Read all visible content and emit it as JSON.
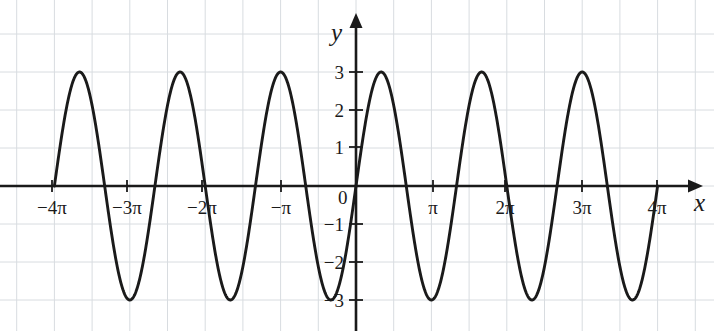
{
  "figure": {
    "background_color": "#ffffff",
    "grid_color": "#d8dce0",
    "axis_color": "#1a1a1a",
    "curve_color": "#1a1a1a",
    "axis_x_name": "x",
    "axis_y_name": "y",
    "origin_label": "0"
  },
  "chart_data": {
    "type": "line",
    "title": "",
    "xlabel": "x",
    "ylabel": "y",
    "expression": "y = 3 sin(3x/2)",
    "amplitude": 3,
    "period": "4π/3",
    "grid": true,
    "legend": "none",
    "xlim": [
      -12.566,
      12.566
    ],
    "ylim": [
      -3.6,
      3.6
    ],
    "x_tick_labels": [
      "−4π",
      "−3π",
      "−2π",
      "−π",
      "π",
      "2π",
      "3π",
      "4π"
    ],
    "x_tick_values": [
      -12.566,
      -9.425,
      -6.283,
      -3.142,
      3.142,
      6.283,
      9.425,
      12.566
    ],
    "y_tick_labels": [
      "3",
      "2",
      "1",
      "0",
      "−1",
      "−2",
      "−3"
    ],
    "y_tick_values": [
      3,
      2,
      1,
      0,
      -1,
      -2,
      -3
    ],
    "x": [
      -12.566,
      -12.042,
      -11.519,
      -10.996,
      -10.472,
      -9.949,
      -9.425,
      -8.902,
      -8.378,
      -7.854,
      -7.33,
      -6.807,
      -6.283,
      -5.76,
      -5.236,
      -4.712,
      -4.189,
      -3.665,
      -3.142,
      -2.618,
      -2.094,
      -1.571,
      -1.047,
      -0.524,
      0,
      0.524,
      1.047,
      1.571,
      2.094,
      2.618,
      3.142,
      3.665,
      4.189,
      4.712,
      5.236,
      5.76,
      6.283,
      6.807,
      7.33,
      7.854,
      8.378,
      8.902,
      9.425,
      9.949,
      10.472,
      10.996,
      11.519,
      12.042,
      12.566
    ],
    "y": [
      0,
      2.121,
      3.0,
      2.121,
      0,
      -2.121,
      -3.0,
      -2.121,
      0,
      2.121,
      3.0,
      2.121,
      0,
      -2.121,
      -3.0,
      -2.121,
      0,
      2.121,
      3.0,
      2.121,
      0,
      -2.121,
      -3.0,
      -2.121,
      0,
      2.121,
      3.0,
      2.121,
      0,
      -2.121,
      -3.0,
      -2.121,
      0,
      2.121,
      3.0,
      2.121,
      0,
      -2.121,
      -3.0,
      -2.121,
      0,
      2.121,
      3.0,
      2.121,
      0,
      -2.121,
      -3.0,
      -2.121,
      0
    ],
    "peaks_at_x": [
      -11.519,
      -7.33,
      -3.142,
      1.047,
      5.236,
      9.425
    ],
    "troughs_at_x": [
      -9.425,
      -5.236,
      -1.047,
      3.142,
      7.33,
      11.519
    ],
    "zero_crossings_x": [
      -12.566,
      -10.472,
      -8.378,
      -6.283,
      -4.189,
      -2.094,
      0,
      2.094,
      4.189,
      6.283,
      8.378,
      10.472,
      12.566
    ]
  },
  "x_axis_labels": [
    {
      "text": "−4π",
      "px": 52
    },
    {
      "text": "−3π",
      "px": 127
    },
    {
      "text": "−2π",
      "px": 202
    },
    {
      "text": "−π",
      "px": 281
    },
    {
      "text": "π",
      "px": 433
    },
    {
      "text": "2π",
      "px": 505
    },
    {
      "text": "3π",
      "px": 582
    },
    {
      "text": "4π",
      "px": 657
    }
  ],
  "y_axis_labels": [
    {
      "text": "3",
      "py": 72
    },
    {
      "text": "2",
      "py": 110
    },
    {
      "text": "1",
      "py": 147
    },
    {
      "text": "−1",
      "py": 224
    },
    {
      "text": "−2",
      "py": 262
    },
    {
      "text": "−3",
      "py": 300
    }
  ]
}
